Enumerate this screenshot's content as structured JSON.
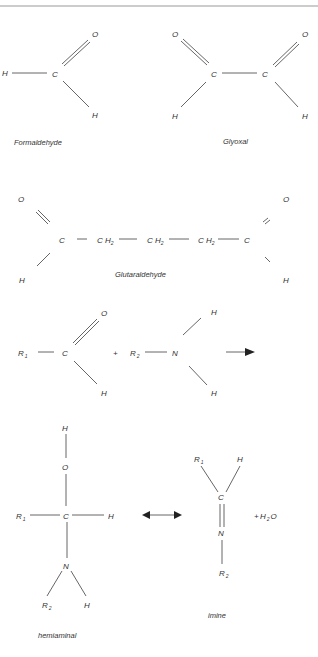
{
  "figure": {
    "molecules": {
      "formaldehyde": {
        "caption": "Formaldehyde",
        "atoms": {
          "h_left": "H",
          "c": "C",
          "o": "O",
          "h_bottom": "H"
        }
      },
      "glyoxal": {
        "caption": "Glyoxal",
        "atoms": {
          "o1": "O",
          "o2": "O",
          "c1": "C",
          "c2": "C",
          "h1": "H",
          "h2": "H"
        }
      },
      "glutaraldehyde": {
        "caption": "Glutaraldehyde",
        "atoms": {
          "o1": "O",
          "o2": "O",
          "c1": "C",
          "c2": "C",
          "h1": "H",
          "h2": "H",
          "ch": "C H",
          "ch_sub": "2"
        }
      }
    },
    "reaction": {
      "reactant1": {
        "r": "R",
        "r_sub": "1",
        "c": "C",
        "o": "O",
        "h": "H"
      },
      "plus1": "+",
      "reactant2": {
        "r": "R",
        "r_sub": "2",
        "n": "N",
        "h1": "H",
        "h2": "H"
      },
      "hemiaminal": {
        "caption": "hemiaminal",
        "atoms": {
          "h_top": "H",
          "o": "O",
          "c": "C",
          "r1": "R",
          "r1_sub": "1",
          "h_right": "H",
          "n": "N",
          "r2": "R",
          "r2_sub": "2",
          "h_n": "H"
        }
      },
      "imine": {
        "caption": "imine",
        "atoms": {
          "r1": "R",
          "r1_sub": "1",
          "h": "H",
          "c": "C",
          "n": "N",
          "r2": "R",
          "r2_sub": "2"
        }
      },
      "water": {
        "plus": "+",
        "h": "H",
        "h_sub": "2",
        "o": "O"
      }
    }
  }
}
